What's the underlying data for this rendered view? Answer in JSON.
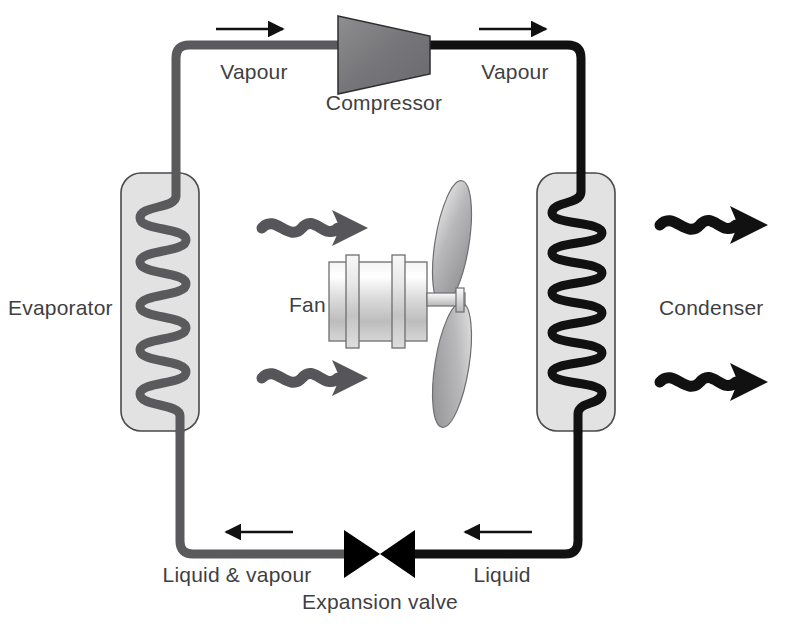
{
  "diagram": {
    "background_color": "#ffffff",
    "text_color": "#3f3f42"
  },
  "components": {
    "evaporator": {
      "label": "Evaporator",
      "coil_color": "#5a5a5c",
      "body_color": "#e2e2e2"
    },
    "condenser": {
      "label": "Condenser",
      "coil_color": "#111111",
      "body_color": "#e2e2e2"
    },
    "compressor": {
      "label": "Compressor",
      "fill_color": "#7a7a7c"
    },
    "expansion_valve": {
      "label": "Expansion valve",
      "fill_color": "#000000"
    },
    "fan": {
      "label": "Fan",
      "body_color": "#d8d8d8",
      "blade_color": "#a9a9ab"
    }
  },
  "flow_labels": {
    "vapour_suction": "Vapour",
    "vapour_discharge": "Vapour",
    "liquid": "Liquid",
    "liquid_and_vapour": "Liquid & vapour"
  },
  "piping": {
    "low_side_color": "#5a5a5c",
    "high_side_color": "#111111"
  },
  "flow_arrows": [
    {
      "name": "suction-flow-arrow",
      "direction": "right"
    },
    {
      "name": "discharge-flow-arrow",
      "direction": "right"
    },
    {
      "name": "liquid-flow-arrow",
      "direction": "left"
    },
    {
      "name": "liquid-vapour-flow-arrow",
      "direction": "left"
    }
  ],
  "heat_arrows": {
    "cold_air_color": "#56565a",
    "hot_air_color": "#111111",
    "cold_count": 2,
    "hot_count": 2
  }
}
